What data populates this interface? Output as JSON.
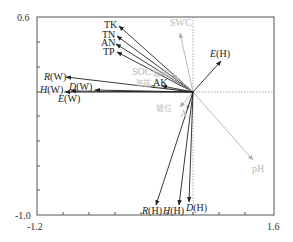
{
  "chart_data": {
    "type": "biplot",
    "title": "",
    "xlabel": "",
    "ylabel": "",
    "xlim": [
      -1.2,
      1.6
    ],
    "ylim": [
      -1.0,
      0.6
    ],
    "x_tick_labels": [
      "-1.2",
      "1.6"
    ],
    "y_tick_labels": [
      "0.6",
      "-1.0"
    ],
    "grid": false,
    "zero_lines": "dotted",
    "origin_px": [
      193,
      92
    ],
    "vectors": [
      {
        "name": "TK",
        "group": "environment",
        "tip_px": [
          119,
          26
        ],
        "label_px": [
          104,
          28
        ],
        "style": "dark"
      },
      {
        "name": "TN",
        "group": "environment",
        "tip_px": [
          117,
          36
        ],
        "label_px": [
          102,
          38
        ],
        "style": "dark"
      },
      {
        "name": "AN",
        "group": "environment",
        "tip_px": [
          116,
          44
        ],
        "label_px": [
          101,
          46
        ],
        "style": "dark"
      },
      {
        "name": "TP",
        "group": "environment",
        "tip_px": [
          117,
          52
        ],
        "label_px": [
          103,
          55
        ],
        "style": "dark"
      },
      {
        "name": "SWC",
        "group": "environment",
        "tip_px": [
          180,
          33
        ],
        "label_px": [
          170,
          26
        ],
        "style": "light"
      },
      {
        "name": "SOC",
        "group": "environment",
        "tip_px": [
          160,
          72
        ],
        "label_px": [
          132,
          75
        ],
        "style": "light"
      },
      {
        "name": "坡向",
        "group": "environment",
        "tip_px": [
          172,
          74
        ],
        "label_px": [
          153,
          76
        ],
        "style": "light-cn"
      },
      {
        "name": "海拔",
        "group": "environment",
        "tip_px": [
          150,
          86
        ],
        "label_px": [
          135,
          86
        ],
        "style": "light-cn"
      },
      {
        "name": "AK",
        "group": "environment",
        "tip_px": [
          162,
          86
        ],
        "label_px": [
          153,
          86
        ],
        "style": "dark"
      },
      {
        "name": "坡位",
        "group": "environment",
        "tip_px": [
          180,
          107
        ],
        "label_px": [
          156,
          111
        ],
        "style": "light-cn"
      },
      {
        "name": "A",
        "group": "environment",
        "tip_px": [
          187,
          110
        ],
        "label_px": [
          180,
          117
        ],
        "style": "light"
      },
      {
        "name": "pH",
        "group": "environment",
        "tip_px": [
          253,
          160
        ],
        "label_px": [
          252,
          172
        ],
        "style": "light"
      },
      {
        "name": "E(H)",
        "group": "diversity",
        "tip_px": [
          221,
          61
        ],
        "label_px": [
          210,
          57
        ],
        "style": "dark"
      },
      {
        "name": "R(W)",
        "group": "diversity",
        "tip_px": [
          66,
          77
        ],
        "label_px": [
          44,
          80
        ],
        "style": "dark"
      },
      {
        "name": "H(W)",
        "group": "diversity",
        "tip_px": [
          71,
          91
        ],
        "label_px": [
          40,
          93
        ],
        "style": "dark"
      },
      {
        "name": "D(W)",
        "group": "diversity",
        "tip_px": [
          95,
          90
        ],
        "label_px": [
          69,
          90
        ],
        "style": "dark"
      },
      {
        "name": "E(W)",
        "group": "diversity",
        "tip_px": [
          65,
          92
        ],
        "label_px": [
          58,
          102
        ],
        "style": "dark"
      },
      {
        "name": "R(H)",
        "group": "diversity",
        "tip_px": [
          156,
          205
        ],
        "label_px": [
          142,
          214
        ],
        "style": "dark"
      },
      {
        "name": "H(H)",
        "group": "diversity",
        "tip_px": [
          179,
          205
        ],
        "label_px": [
          163,
          214
        ],
        "style": "dark"
      },
      {
        "name": "D(H)",
        "group": "diversity",
        "tip_px": [
          189,
          202
        ],
        "label_px": [
          186,
          211
        ],
        "style": "dark"
      }
    ]
  },
  "axes": {
    "x_min_label": "-1.2",
    "x_max_label": "1.6",
    "y_max_label": "0.6",
    "y_min_label": "-1.0"
  }
}
